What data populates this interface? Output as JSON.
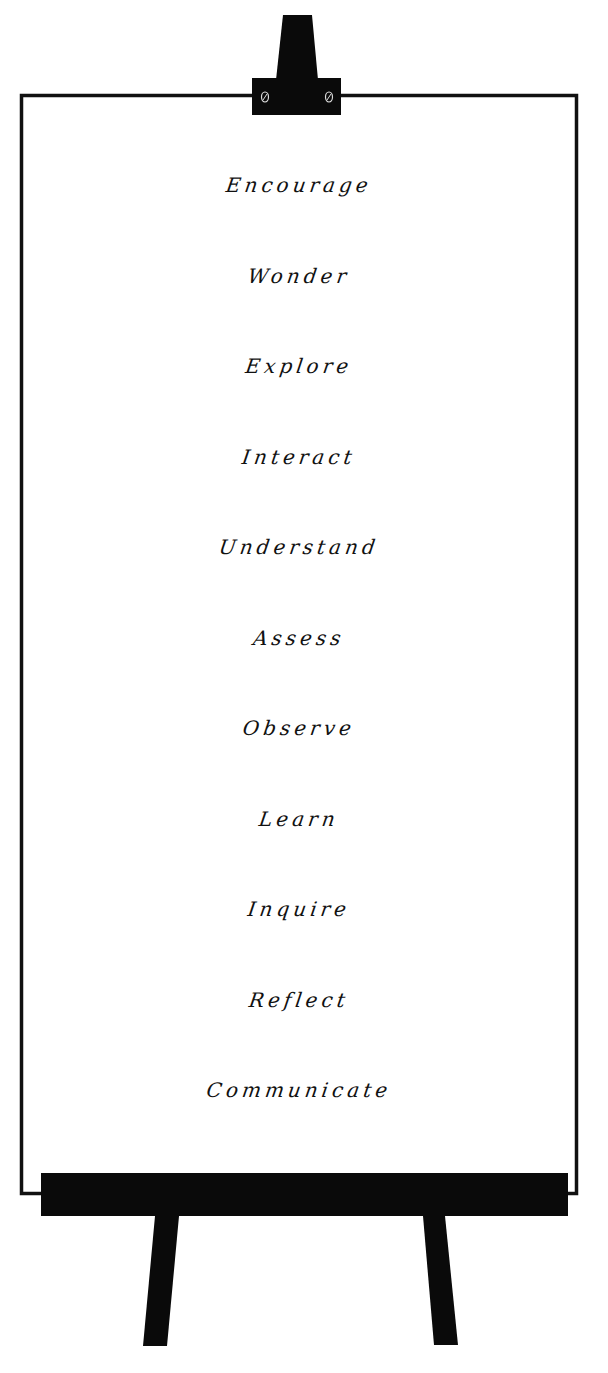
{
  "poster": {
    "words": [
      "Encourage",
      "Wonder",
      "Explore",
      "Interact",
      "Understand",
      "Assess",
      "Observe",
      "Learn",
      "Inquire",
      "Reflect",
      "Communicate"
    ]
  },
  "colors": {
    "ink": "#111111",
    "board": "#ffffff",
    "easel": "#0a0a0a"
  }
}
